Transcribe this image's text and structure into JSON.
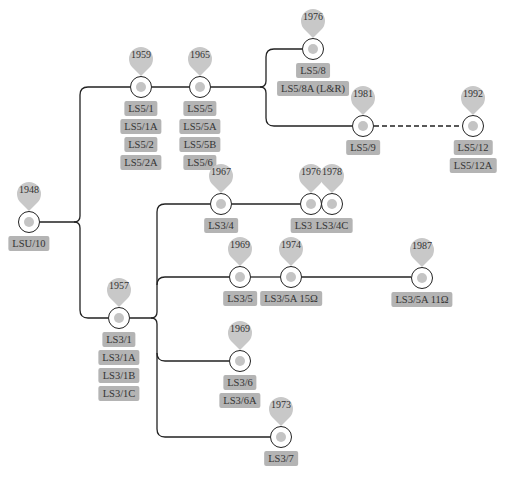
{
  "colors": {
    "line": "#222222",
    "pin": "#c8c8c8",
    "tag_bg": "#b4b4b4",
    "dot": "#c4c4c4",
    "text": "#333333"
  },
  "nodes": [
    {
      "id": "n1948",
      "year": "1948",
      "x": 29,
      "y": 222,
      "labels": [
        "LSU/10"
      ]
    },
    {
      "id": "n1959",
      "year": "1959",
      "x": 141,
      "y": 87,
      "labels": [
        "LS5/1",
        "LS5/1A",
        "LS5/2",
        "LS5/2A"
      ]
    },
    {
      "id": "n1965",
      "year": "1965",
      "x": 200,
      "y": 87,
      "labels": [
        "LS5/5",
        "LS5/5A",
        "LS5/5B",
        "LS5/6"
      ]
    },
    {
      "id": "n1976a",
      "year": "1976",
      "x": 313,
      "y": 49,
      "labels": [
        "LS5/8",
        "LS5/8A (L&R)"
      ]
    },
    {
      "id": "n1981",
      "year": "1981",
      "x": 363,
      "y": 126,
      "labels": [
        "LS5/9"
      ]
    },
    {
      "id": "n1992",
      "year": "1992",
      "x": 473,
      "y": 126,
      "labels": [
        "LS5/12",
        "LS5/12A"
      ]
    },
    {
      "id": "n1957",
      "year": "1957",
      "x": 119,
      "y": 318,
      "labels": [
        "LS3/1",
        "LS3/1A",
        "LS3/1B",
        "LS3/1C"
      ]
    },
    {
      "id": "n1967",
      "year": "1967",
      "x": 221,
      "y": 204,
      "labels": [
        "LS3/4"
      ]
    },
    {
      "id": "n1976b",
      "year": "1976",
      "x": 311,
      "y": 204,
      "labels": [
        "LS3/4B"
      ]
    },
    {
      "id": "n1978",
      "year": "1978",
      "x": 332,
      "y": 204,
      "labels": [
        "LS3/4C"
      ]
    },
    {
      "id": "n1969a",
      "year": "1969",
      "x": 240,
      "y": 277,
      "labels": [
        "LS3/5"
      ]
    },
    {
      "id": "n1974",
      "year": "1974",
      "x": 291,
      "y": 277,
      "labels": [
        "LS3/5A  15Ω"
      ]
    },
    {
      "id": "n1987",
      "year": "1987",
      "x": 422,
      "y": 278,
      "labels": [
        "LS3/5A  11Ω"
      ]
    },
    {
      "id": "n1969b",
      "year": "1969",
      "x": 240,
      "y": 361,
      "labels": [
        "LS3/6",
        "LS3/6A"
      ]
    },
    {
      "id": "n1973",
      "year": "1973",
      "x": 281,
      "y": 437,
      "labels": [
        "LS3/7"
      ]
    }
  ]
}
